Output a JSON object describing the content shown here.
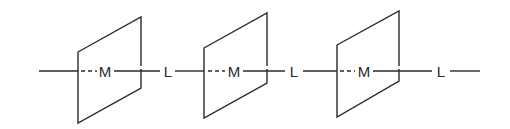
{
  "diagram": {
    "colors": {
      "stroke": "#2a2a2a",
      "background": "#ffffff"
    },
    "axis_y": 71,
    "labels": [
      {
        "id": "m1",
        "text": "M",
        "x": 105
      },
      {
        "id": "l1",
        "text": "L",
        "x": 168
      },
      {
        "id": "m2",
        "text": "M",
        "x": 234
      },
      {
        "id": "l2",
        "text": "L",
        "x": 294
      },
      {
        "id": "m3",
        "text": "M",
        "x": 364
      },
      {
        "id": "l3",
        "text": "L",
        "x": 441
      }
    ],
    "panels": [
      {
        "id": "panel-1",
        "points": "78,52 141,17 141,88 78,123"
      },
      {
        "id": "panel-2",
        "points": "204,48 267,13 267,83 204,118"
      },
      {
        "id": "panel-3",
        "points": "337,45 399,11 399,81 337,117"
      }
    ]
  }
}
